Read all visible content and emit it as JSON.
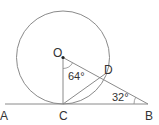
{
  "diagram": {
    "type": "geometry",
    "colors": {
      "line": "#8a8a8a",
      "text": "#333333",
      "background": "#ffffff"
    },
    "points": {
      "O": {
        "label": "O",
        "x": 63,
        "y": 57.5
      },
      "C": {
        "label": "C",
        "x": 63,
        "y": 104
      },
      "D": {
        "label": "D",
        "x": 105,
        "y": 74
      },
      "A": {
        "label": "A",
        "x": 5,
        "y": 104
      },
      "B": {
        "label": "B",
        "x": 148,
        "y": 104
      }
    },
    "circle": {
      "center": "O",
      "radius": 46.5
    },
    "segments": [
      "AB",
      "OC",
      "OD",
      "DB",
      "CD"
    ],
    "angles": {
      "COD": {
        "label": "64°",
        "vertex": "O"
      },
      "DBC": {
        "label": "32°",
        "vertex": "B"
      }
    }
  }
}
